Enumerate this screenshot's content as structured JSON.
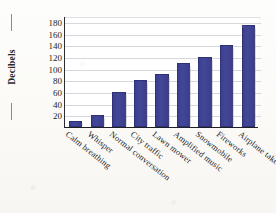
{
  "chart_data": {
    "type": "bar",
    "title": "",
    "xlabel": "",
    "ylabel": "Decibels",
    "ylim": [
      0,
      190
    ],
    "grid": true,
    "legend": "none",
    "yticks": [
      180,
      160,
      140,
      120,
      100,
      80,
      60,
      40,
      20
    ],
    "categories": [
      "Calm breathing",
      "Whisper",
      "Normal conversation",
      "City traffic",
      "Lawn mower",
      "Amplified music",
      "Snowmobile",
      "Fireworks",
      "Airplane takeoff"
    ],
    "values": [
      10,
      20,
      60,
      80,
      90,
      110,
      120,
      140,
      175
    ],
    "bar_color": "#3e4293",
    "gridline_color": "#d7d7dd",
    "axis_color": "#232329"
  }
}
